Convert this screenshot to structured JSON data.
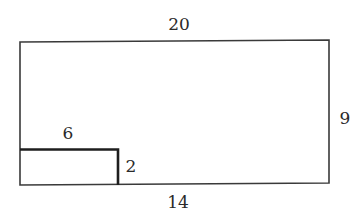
{
  "figure": {
    "type": "geometry-diagram",
    "colors": {
      "stroke": "#3a3a3a",
      "inner_stroke": "#1e1e1e",
      "text": "#2a2a2a",
      "background": "#ffffff"
    },
    "labels": {
      "top": "20",
      "right": "9",
      "bottom": "14",
      "inner_top": "6",
      "inner_right": "2"
    }
  }
}
